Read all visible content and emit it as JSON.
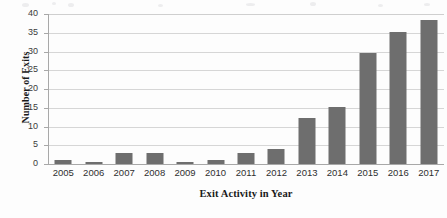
{
  "figure": {
    "background_color": "#fdfdfd",
    "bar_color": "#6e6e6e",
    "gridline_color": "#d6d6d6",
    "axis_color": "#a8a8a8"
  },
  "chart_data": {
    "type": "bar",
    "title": "",
    "xlabel": "Exit Activity in Year",
    "ylabel": "Number of Exits",
    "categories": [
      "2005",
      "2006",
      "2007",
      "2008",
      "2009",
      "2010",
      "2011",
      "2012",
      "2013",
      "2014",
      "2015",
      "2016",
      "2017"
    ],
    "values": [
      1,
      0.5,
      3,
      3,
      0.5,
      1,
      3,
      4,
      12.2,
      15.3,
      29.5,
      35.3,
      38.4
    ],
    "ylim": [
      0,
      40
    ],
    "yticks": [
      0,
      5,
      10,
      15,
      20,
      25,
      30,
      35,
      40
    ],
    "ytick_labels": [
      "0",
      "5",
      "10",
      "15",
      "20",
      "25",
      "30",
      "35",
      "40"
    ],
    "grid": true,
    "grid_axis": "y",
    "legend": false,
    "legend_position": "none",
    "orientation": "vertical",
    "series": [
      {
        "name": "Number of Exits",
        "values": [
          1,
          0.5,
          3,
          3,
          0.5,
          1,
          3,
          4,
          12.2,
          15.3,
          29.5,
          35.3,
          38.4
        ]
      }
    ]
  }
}
